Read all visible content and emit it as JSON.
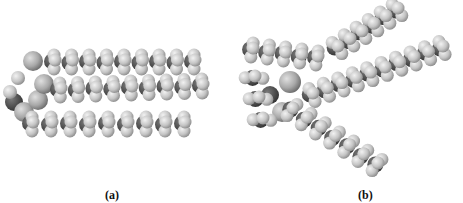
{
  "figure": {
    "panels": [
      {
        "id": "a",
        "label": "(a)",
        "description": "space-filling molecular model, compact parallel chains"
      },
      {
        "id": "b",
        "label": "(b)",
        "description": "space-filling molecular model, splayed chains"
      }
    ],
    "colors": {
      "background": "#ffffff",
      "carbon": "#4a4a4a",
      "hydrogen": "#c8c8c8",
      "oxygen": "#9a9a9a"
    }
  }
}
